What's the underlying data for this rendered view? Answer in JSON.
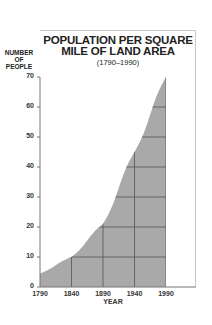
{
  "chart_data": {
    "type": "area",
    "title": "POPULATION PER SQUARE MILE OF LAND AREA",
    "title_lines": [
      "POPULATION PER SQUARE",
      "MILE OF LAND AREA"
    ],
    "subtitle": "(1790–1990)",
    "xlabel": "YEAR",
    "ylabel": "NUMBER OF PEOPLE",
    "ylabel_lines": [
      "NUMBER",
      "OF",
      "PEOPLE"
    ],
    "x": [
      1790,
      1840,
      1890,
      1940,
      1990
    ],
    "values": [
      4.5,
      10,
      21,
      45,
      70
    ],
    "x_ticks": [
      "1790",
      "1840",
      "1890",
      "1940",
      "1990"
    ],
    "y_ticks": [
      "0",
      "10",
      "20",
      "30",
      "40",
      "50",
      "60",
      "70"
    ],
    "xlim": [
      1790,
      1990
    ],
    "ylim": [
      0,
      70
    ],
    "grid": true,
    "fill_color": "#a9a9a9",
    "grid_color": "#555555"
  }
}
